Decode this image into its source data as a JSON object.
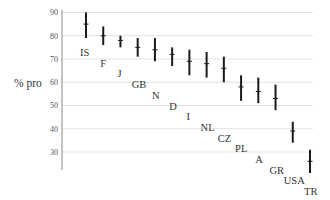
{
  "chart_data": {
    "type": "scatter",
    "subtype": "interval-plot",
    "title": "",
    "xlabel": "",
    "ylabel": "% pro",
    "ylim": [
      22,
      92
    ],
    "yticks": [
      30,
      40,
      50,
      60,
      70,
      80,
      90
    ],
    "grid": true,
    "legend": null,
    "categories": [
      "IS",
      "F",
      "J",
      "GB",
      "N",
      "D",
      "I",
      "NL",
      "CZ",
      "PL",
      "A",
      "GR",
      "USA",
      "TR"
    ],
    "values": [
      85,
      80,
      78,
      75,
      74,
      72,
      69,
      68,
      66,
      58,
      56,
      53,
      39,
      26
    ],
    "lower": [
      79,
      76,
      75,
      71,
      69,
      67,
      63,
      62,
      60,
      52,
      51,
      48,
      34,
      21
    ],
    "upper": [
      90,
      84,
      80,
      79,
      79,
      75,
      74,
      73,
      71,
      63,
      62,
      59,
      43,
      31
    ],
    "series": [
      {
        "name": "% pro",
        "points": [
          {
            "label": "IS",
            "value": 85,
            "low": 79,
            "high": 90
          },
          {
            "label": "F",
            "value": 80,
            "low": 76,
            "high": 84
          },
          {
            "label": "J",
            "value": 78,
            "low": 75,
            "high": 80
          },
          {
            "label": "GB",
            "value": 75,
            "low": 71,
            "high": 79
          },
          {
            "label": "N",
            "value": 74,
            "low": 69,
            "high": 79
          },
          {
            "label": "D",
            "value": 72,
            "low": 67,
            "high": 75
          },
          {
            "label": "I",
            "value": 69,
            "low": 63,
            "high": 74
          },
          {
            "label": "NL",
            "value": 68,
            "low": 62,
            "high": 73
          },
          {
            "label": "CZ",
            "value": 66,
            "low": 60,
            "high": 71
          },
          {
            "label": "PL",
            "value": 58,
            "low": 52,
            "high": 63
          },
          {
            "label": "A",
            "value": 56,
            "low": 51,
            "high": 62
          },
          {
            "label": "GR",
            "value": 53,
            "low": 48,
            "high": 59
          },
          {
            "label": "USA",
            "value": 39,
            "low": 34,
            "high": 43
          },
          {
            "label": "TR",
            "value": 26,
            "low": 21,
            "high": 31
          }
        ]
      }
    ]
  },
  "colors": {
    "bar": "#1a1a1a",
    "grid": "#e2e2e2",
    "axis": "#8a8a8a",
    "text": "#333333"
  }
}
